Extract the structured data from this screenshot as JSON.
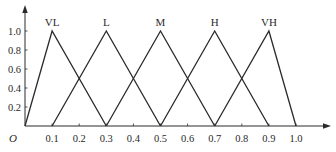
{
  "chart_data": {
    "type": "line",
    "title": "",
    "xlabel": "",
    "ylabel": "",
    "xlim": [
      0,
      1.0
    ],
    "ylim": [
      0,
      1.0
    ],
    "grid": false,
    "legend": "none (labels placed above peaks)",
    "origin_label": "O",
    "x_ticks": [
      "0.1",
      "0.2",
      "0.3",
      "0.4",
      "0.5",
      "0.6",
      "0.7",
      "0.8",
      "0.9",
      "1.0"
    ],
    "x_tick_values": [
      0.1,
      0.2,
      0.3,
      0.4,
      0.5,
      0.6,
      0.7,
      0.8,
      0.9,
      1.0
    ],
    "y_ticks": [
      "0.2",
      "0.4",
      "0.6",
      "0.8",
      "1.0"
    ],
    "y_tick_values": [
      0.2,
      0.4,
      0.6,
      0.8,
      1.0
    ],
    "series": [
      {
        "name": "VL",
        "x": [
          0.0,
          0.1,
          0.3
        ],
        "y": [
          0,
          1,
          0
        ]
      },
      {
        "name": "L",
        "x": [
          0.1,
          0.3,
          0.5
        ],
        "y": [
          0,
          1,
          0
        ]
      },
      {
        "name": "M",
        "x": [
          0.3,
          0.5,
          0.7
        ],
        "y": [
          0,
          1,
          0
        ]
      },
      {
        "name": "H",
        "x": [
          0.5,
          0.7,
          0.9
        ],
        "y": [
          0,
          1,
          0
        ]
      },
      {
        "name": "VH",
        "x": [
          0.7,
          0.9,
          1.0
        ],
        "y": [
          0,
          1,
          0
        ]
      }
    ],
    "line_color": "#2a2a2a"
  }
}
